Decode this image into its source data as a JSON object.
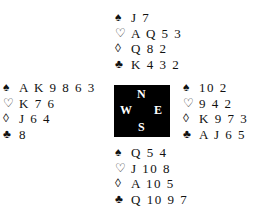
{
  "suits": {
    "spades": "♠",
    "hearts": "♡",
    "diamonds": "◊",
    "clubs": "♣"
  },
  "hands": {
    "north": {
      "spades": "J 7",
      "hearts": "A Q 5 3",
      "diamonds": "Q 8 2",
      "clubs": "K 4 3 2"
    },
    "west": {
      "spades": "A K 9 8 6 3",
      "hearts": "K 7 6",
      "diamonds": "J 6 4",
      "clubs": "8"
    },
    "east": {
      "spades": "10 2",
      "hearts": "9 4 2",
      "diamonds": "K 9 7 3",
      "clubs": "A J 6 5"
    },
    "south": {
      "spades": "Q 5 4",
      "hearts": "J 10 8",
      "diamonds": "A 10 5",
      "clubs": "Q 10 9 7"
    }
  },
  "compass": {
    "north": "N",
    "south": "S",
    "west": "W",
    "east": "E",
    "background": "#000000",
    "text_color": "#ffffff"
  }
}
